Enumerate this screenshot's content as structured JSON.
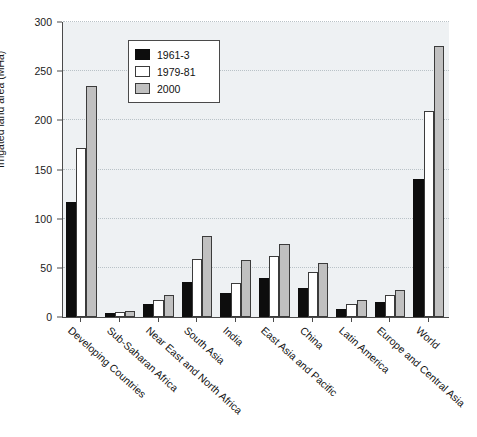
{
  "chart_data": {
    "type": "bar",
    "title": "",
    "xlabel": "",
    "ylabel": "Irrigated land area (MHa)",
    "ylim": [
      0,
      300
    ],
    "ytick_step": 50,
    "yticks": [
      0,
      50,
      100,
      150,
      200,
      250,
      300
    ],
    "grid": true,
    "legend_position": "top-left-inside",
    "categories": [
      "Developing Countries",
      "Sub-Saharan Africa",
      "Near East and North Africa",
      "South Asia",
      "India",
      "East Asia and Pacific",
      "China",
      "Latin America",
      "Europe and Central Asia",
      "World"
    ],
    "series": [
      {
        "name": "1961-3",
        "color": "#0d0d0d",
        "values": [
          117,
          4,
          13,
          36,
          24,
          40,
          29,
          8,
          15,
          140
        ]
      },
      {
        "name": "1979-81",
        "color": "#ffffff",
        "values": [
          172,
          5,
          17,
          59,
          35,
          62,
          46,
          13,
          22,
          209
        ]
      },
      {
        "name": "2000",
        "color": "#c0c0c0",
        "values": [
          235,
          6,
          22,
          82,
          58,
          74,
          55,
          17,
          27,
          276
        ]
      }
    ]
  },
  "axis": {
    "y_title": "Irrigated land area (MHa)"
  }
}
